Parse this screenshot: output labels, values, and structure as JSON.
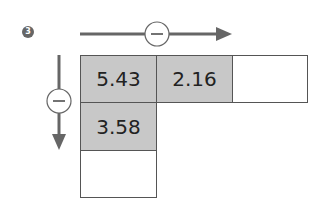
{
  "step_badge": "3",
  "colors": {
    "arrow": "#666666",
    "filled_cell": "#c8c8c8",
    "empty_cell": "#ffffff",
    "border": "#555555",
    "operator_circle": "#ffffff"
  },
  "horizontal_arrow": {
    "operator": "−",
    "direction": "right"
  },
  "vertical_arrow": {
    "operator": "−",
    "direction": "down"
  },
  "grid": {
    "row1": [
      "5.43",
      "2.16",
      ""
    ],
    "col1": [
      "5.43",
      "3.58",
      ""
    ]
  },
  "cells": {
    "r1c1": "5.43",
    "r1c2": "2.16",
    "r1c3": "",
    "r2c1": "3.58",
    "r3c1": ""
  }
}
